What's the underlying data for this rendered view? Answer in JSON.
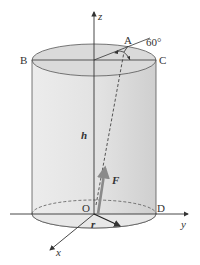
{
  "diagram": {
    "type": "cylinder-force-3d",
    "labels": {
      "z_axis": "z",
      "y_axis": "y",
      "x_axis": "x",
      "point_a": "A",
      "point_b": "B",
      "point_c": "C",
      "point_d": "D",
      "origin": "O",
      "angle": "60°",
      "height": "h",
      "force": "F",
      "radius": "r"
    },
    "colors": {
      "cylinder_fill": "#e6e6e6",
      "cylinder_side_dark": "#d2d2d2",
      "top_fill": "#d9d9d9",
      "force_arrow": "#8a8a8a",
      "line": "#333333"
    }
  }
}
